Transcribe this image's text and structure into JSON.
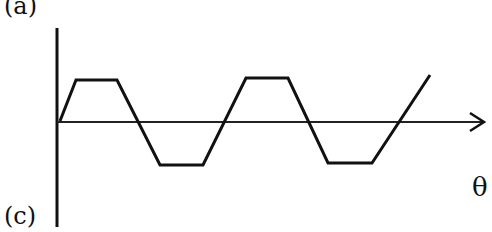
{
  "labels": {
    "top_left": "(a)",
    "bottom_left": "(c)",
    "x_axis": "θ"
  },
  "chart_data": {
    "type": "line",
    "title": "",
    "xlabel": "θ",
    "ylabel": "",
    "points_px": [
      [
        60,
        121
      ],
      [
        76,
        80
      ],
      [
        117,
        80
      ],
      [
        160,
        165
      ],
      [
        203,
        165
      ],
      [
        246,
        78
      ],
      [
        288,
        78
      ],
      [
        328,
        163
      ],
      [
        372,
        163
      ],
      [
        430,
        75
      ]
    ],
    "axis_y_px": 121,
    "grid": false,
    "legend": null
  },
  "colors": {
    "stroke": "#111111",
    "background": "#ffffff"
  }
}
